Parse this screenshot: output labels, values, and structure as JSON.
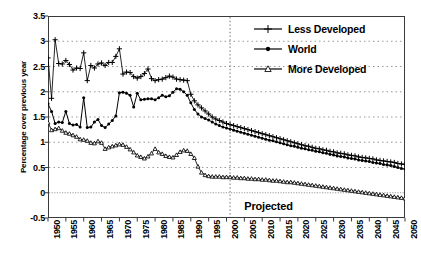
{
  "chart_data": {
    "type": "line",
    "title": "",
    "xlabel": "",
    "ylabel": "Percentage over previous year",
    "xlim": [
      1950,
      2050
    ],
    "ylim": [
      -0.5,
      3.5
    ],
    "ytick_values": [
      3.5,
      3,
      2.5,
      2,
      1.5,
      1,
      0.5,
      0,
      -0.5
    ],
    "ytick_labels": [
      "3.5",
      "3",
      "2.5",
      "2",
      "1.5",
      "1",
      "0.5",
      "0",
      "-0.5"
    ],
    "xtick_values": [
      1950,
      1955,
      1960,
      1965,
      1970,
      1975,
      1980,
      1985,
      1990,
      1995,
      2000,
      2005,
      2010,
      2015,
      2020,
      2025,
      2030,
      2035,
      2040,
      2045,
      2050
    ],
    "xtick_labels": [
      "1950",
      "1955",
      "1960",
      "1965",
      "1970",
      "1975",
      "1980",
      "1985",
      "1990",
      "1995",
      "2000",
      "2005",
      "2010",
      "2015",
      "2020",
      "2025",
      "2030",
      "2035",
      "2040",
      "2045",
      "2050"
    ],
    "grid": true,
    "grid_axis": "y",
    "legend_position": "top-right",
    "annotations": [
      {
        "name": "projected-divider",
        "type": "vline",
        "x": 2001,
        "style": "dotted"
      },
      {
        "name": "projected-text",
        "type": "text",
        "text": "Projected",
        "x": 2005,
        "y": -0.28
      }
    ],
    "x": [
      1950,
      1951,
      1952,
      1953,
      1954,
      1955,
      1956,
      1957,
      1958,
      1959,
      1960,
      1961,
      1962,
      1963,
      1964,
      1965,
      1966,
      1967,
      1968,
      1969,
      1970,
      1971,
      1972,
      1973,
      1974,
      1975,
      1976,
      1977,
      1978,
      1979,
      1980,
      1981,
      1982,
      1983,
      1984,
      1985,
      1986,
      1987,
      1988,
      1989,
      1990,
      1991,
      1992,
      1993,
      1994,
      1995,
      1996,
      1997,
      1998,
      1999,
      2000,
      2001,
      2002,
      2003,
      2004,
      2005,
      2006,
      2007,
      2008,
      2009,
      2010,
      2011,
      2012,
      2013,
      2014,
      2015,
      2016,
      2017,
      2018,
      2019,
      2020,
      2021,
      2022,
      2023,
      2024,
      2025,
      2026,
      2027,
      2028,
      2029,
      2030,
      2031,
      2032,
      2033,
      2034,
      2035,
      2036,
      2037,
      2038,
      2039,
      2040,
      2041,
      2042,
      2043,
      2044,
      2045,
      2046,
      2047,
      2048,
      2049,
      2050
    ],
    "series": [
      {
        "name": "Less Developed",
        "marker": "plus",
        "color": "#000000",
        "values": [
          2.67,
          1.87,
          3.03,
          2.56,
          2.55,
          2.62,
          2.54,
          2.43,
          2.47,
          2.46,
          2.77,
          2.22,
          2.52,
          2.47,
          2.55,
          2.57,
          2.52,
          2.58,
          2.58,
          2.7,
          2.85,
          2.35,
          2.39,
          2.38,
          2.3,
          2.27,
          2.3,
          2.36,
          2.45,
          2.26,
          2.22,
          2.24,
          2.25,
          2.28,
          2.31,
          2.29,
          2.25,
          2.24,
          2.23,
          2.22,
          1.95,
          1.82,
          1.74,
          1.68,
          1.62,
          1.56,
          1.5,
          1.46,
          1.43,
          1.4,
          1.37,
          1.35,
          1.33,
          1.31,
          1.29,
          1.27,
          1.25,
          1.23,
          1.21,
          1.19,
          1.17,
          1.15,
          1.13,
          1.11,
          1.09,
          1.07,
          1.05,
          1.03,
          1.01,
          0.99,
          0.97,
          0.95,
          0.93,
          0.92,
          0.9,
          0.88,
          0.87,
          0.85,
          0.84,
          0.82,
          0.81,
          0.79,
          0.78,
          0.77,
          0.75,
          0.74,
          0.73,
          0.71,
          0.7,
          0.69,
          0.68,
          0.67,
          0.65,
          0.64,
          0.63,
          0.62,
          0.61,
          0.6,
          0.58,
          0.57,
          0.56
        ]
      },
      {
        "name": "World",
        "marker": "circle-filled",
        "color": "#000000",
        "values": [
          1.76,
          1.61,
          1.37,
          1.4,
          1.39,
          1.61,
          1.37,
          1.34,
          1.35,
          1.3,
          1.88,
          1.29,
          1.3,
          1.4,
          1.45,
          1.33,
          1.29,
          1.36,
          1.43,
          1.52,
          1.98,
          1.99,
          1.97,
          1.93,
          1.7,
          1.97,
          1.84,
          1.85,
          1.86,
          1.86,
          1.84,
          1.88,
          1.93,
          1.9,
          1.92,
          1.99,
          2.06,
          2.05,
          2.0,
          1.93,
          1.78,
          1.65,
          1.56,
          1.5,
          1.47,
          1.44,
          1.4,
          1.36,
          1.33,
          1.3,
          1.28,
          1.26,
          1.24,
          1.22,
          1.2,
          1.18,
          1.16,
          1.14,
          1.12,
          1.1,
          1.08,
          1.06,
          1.04,
          1.03,
          1.01,
          0.99,
          0.97,
          0.95,
          0.93,
          0.92,
          0.9,
          0.88,
          0.87,
          0.85,
          0.84,
          0.82,
          0.81,
          0.79,
          0.78,
          0.76,
          0.75,
          0.73,
          0.72,
          0.71,
          0.69,
          0.68,
          0.67,
          0.65,
          0.64,
          0.63,
          0.62,
          0.6,
          0.59,
          0.58,
          0.56,
          0.55,
          0.54,
          0.52,
          0.5,
          0.48,
          0.47
        ]
      },
      {
        "name": "More Developed",
        "marker": "triangle-open",
        "color": "#000000",
        "values": [
          1.39,
          1.24,
          1.26,
          1.28,
          1.23,
          1.19,
          1.17,
          1.14,
          1.11,
          1.06,
          1.05,
          1.03,
          0.99,
          0.98,
          1.02,
          0.99,
          0.87,
          0.9,
          0.92,
          0.94,
          0.96,
          0.95,
          0.91,
          0.86,
          0.8,
          0.74,
          0.71,
          0.68,
          0.72,
          0.78,
          0.87,
          0.8,
          0.77,
          0.73,
          0.71,
          0.7,
          0.75,
          0.81,
          0.84,
          0.83,
          0.77,
          0.69,
          0.52,
          0.4,
          0.35,
          0.33,
          0.32,
          0.32,
          0.32,
          0.31,
          0.31,
          0.31,
          0.3,
          0.3,
          0.29,
          0.29,
          0.28,
          0.28,
          0.27,
          0.27,
          0.26,
          0.26,
          0.25,
          0.24,
          0.24,
          0.23,
          0.22,
          0.21,
          0.21,
          0.2,
          0.19,
          0.18,
          0.17,
          0.16,
          0.15,
          0.14,
          0.13,
          0.12,
          0.11,
          0.1,
          0.09,
          0.08,
          0.07,
          0.06,
          0.05,
          0.04,
          0.03,
          0.02,
          0.01,
          0.0,
          -0.01,
          -0.02,
          -0.03,
          -0.04,
          -0.05,
          -0.06,
          -0.07,
          -0.08,
          -0.09,
          -0.1,
          -0.11
        ]
      }
    ]
  }
}
